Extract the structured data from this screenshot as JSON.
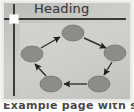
{
  "document": {
    "heading": "Heading",
    "caption": "Example page with slide",
    "colors": {
      "page_background": "#c6c6c3",
      "frame_border": "#e9e9e7",
      "rule": "#3b3b3b",
      "guide": "#3b3b3b",
      "handle": "#ffffff",
      "node_fill": "#8c8c8a",
      "node_stroke": "#6e6e6c",
      "edge": "#2f2f2f"
    }
  },
  "rule": {
    "label": "horizontal-rule"
  },
  "guide": {
    "label": "left-margin-guide",
    "handle_label": "selection-handle"
  },
  "diagram": {
    "type": "cycle",
    "title": "",
    "node_count": 5,
    "nodes": [
      {
        "id": "n1",
        "label": "",
        "cx": 55,
        "cy": 11,
        "rx": 11,
        "ry": 8,
        "position": "top"
      },
      {
        "id": "n2",
        "label": "",
        "cx": 97,
        "cy": 31,
        "rx": 11,
        "ry": 8,
        "position": "right"
      },
      {
        "id": "n3",
        "label": "",
        "cx": 81,
        "cy": 62,
        "rx": 11,
        "ry": 8,
        "position": "bottom-right"
      },
      {
        "id": "n4",
        "label": "",
        "cx": 33,
        "cy": 62,
        "rx": 11,
        "ry": 8,
        "position": "bottom-left"
      },
      {
        "id": "n5",
        "label": "",
        "cx": 14,
        "cy": 32,
        "rx": 11,
        "ry": 8,
        "position": "left"
      }
    ],
    "edges": [
      {
        "from": "n1",
        "to": "n2",
        "label": "",
        "direction": "down-right"
      },
      {
        "from": "n2",
        "to": "n3",
        "label": "",
        "direction": "down-left"
      },
      {
        "from": "n3",
        "to": "n4",
        "label": "",
        "direction": "left"
      },
      {
        "from": "n4",
        "to": "n5",
        "label": "",
        "direction": "up-left"
      },
      {
        "from": "n5",
        "to": "n1",
        "label": "",
        "direction": "up-right"
      }
    ]
  }
}
